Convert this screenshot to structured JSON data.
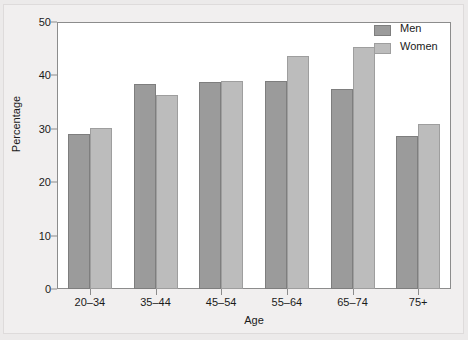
{
  "chart_data": {
    "type": "bar",
    "title": "",
    "xlabel": "Age",
    "ylabel": "Percentage",
    "categories": [
      "20–34",
      "35–44",
      "45–54",
      "55–64",
      "65–74",
      "75+"
    ],
    "series": [
      {
        "name": "Men",
        "color": "#9b9b9b",
        "values": [
          29.0,
          38.4,
          38.8,
          38.9,
          37.4,
          28.6
        ]
      },
      {
        "name": "Women",
        "color": "#bcbcbc",
        "values": [
          30.2,
          36.3,
          38.9,
          43.7,
          45.3,
          30.9
        ]
      }
    ],
    "ylim": [
      0,
      50
    ],
    "yticks": [
      0,
      10,
      20,
      30,
      40,
      50
    ],
    "ytick_labels": [
      "0",
      "10",
      "20",
      "30",
      "40",
      "50"
    ],
    "grid": false,
    "legend_position": "top-right",
    "legend_entries": [
      "Men",
      "Women"
    ],
    "background_color": "#ffffff",
    "frame_color": "#8c8c8c"
  }
}
